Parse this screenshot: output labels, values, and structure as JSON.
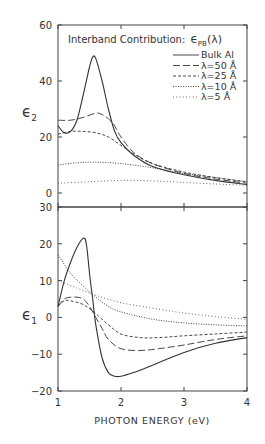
{
  "chart_data": [
    {
      "panel": "upper",
      "type": "line",
      "title": "Interband Contribution: εPB(λ)",
      "ylabel": "ε2",
      "xlabel": "",
      "xlim": [
        1,
        4
      ],
      "ylim": [
        0,
        60
      ],
      "yticks": [
        0,
        20,
        40,
        60
      ],
      "xticks": [
        1,
        2,
        3,
        4
      ],
      "legend_position": "upper right",
      "series": [
        {
          "name": "Bulk Al",
          "style": "solid",
          "x": [
            1.0,
            1.1,
            1.2,
            1.3,
            1.4,
            1.5,
            1.55,
            1.6,
            1.7,
            1.8,
            1.9,
            2.0,
            2.2,
            2.5,
            3.0,
            3.5,
            4.0
          ],
          "y": [
            24,
            21.5,
            22,
            26,
            35,
            45,
            48.5,
            48,
            40,
            30,
            22,
            18,
            13.5,
            9.5,
            6.5,
            4.5,
            3
          ]
        },
        {
          "name": "λ=50 Å",
          "style": "long-dash",
          "x": [
            1.0,
            1.2,
            1.4,
            1.6,
            1.7,
            1.8,
            1.9,
            2.0,
            2.2,
            2.5,
            3.0,
            3.5,
            4.0
          ],
          "y": [
            26,
            26,
            27,
            28.5,
            28,
            26.5,
            24,
            20,
            14.5,
            10.5,
            7,
            5,
            3.5
          ]
        },
        {
          "name": "λ=25 Å",
          "style": "short-dash",
          "x": [
            1.0,
            1.2,
            1.4,
            1.6,
            1.8,
            2.0,
            2.2,
            2.5,
            3.0,
            3.5,
            4.0
          ],
          "y": [
            21,
            22,
            22,
            21.5,
            20,
            17,
            14,
            10.5,
            7.5,
            5.5,
            4
          ]
        },
        {
          "name": "λ=10 Å",
          "style": "dotted",
          "x": [
            1.0,
            1.3,
            1.6,
            2.0,
            2.5,
            3.0,
            3.5,
            4.0
          ],
          "y": [
            10,
            10.8,
            11,
            10.5,
            9,
            7,
            5.5,
            4
          ]
        },
        {
          "name": "λ=5 Å",
          "style": "sparse-dotted",
          "x": [
            1.0,
            1.5,
            2.0,
            2.5,
            3.0,
            3.5,
            4.0
          ],
          "y": [
            3.5,
            4,
            4.5,
            4.3,
            3.8,
            3.2,
            2.8
          ]
        }
      ]
    },
    {
      "panel": "lower",
      "type": "line",
      "ylabel": "ε1",
      "xlabel": "PHOTON ENERGY (eV)",
      "xlim": [
        1,
        4
      ],
      "ylim": [
        -20,
        30
      ],
      "yticks": [
        -20,
        -10,
        0,
        10,
        20,
        30
      ],
      "xticks": [
        1,
        2,
        3,
        4
      ],
      "series": [
        {
          "name": "Bulk Al",
          "style": "solid",
          "x": [
            1.0,
            1.1,
            1.2,
            1.3,
            1.4,
            1.45,
            1.5,
            1.55,
            1.6,
            1.7,
            1.8,
            1.9,
            2.0,
            2.2,
            2.5,
            3.0,
            3.5,
            4.0
          ],
          "y": [
            3,
            10,
            15,
            19,
            21.5,
            20,
            12,
            5,
            -2,
            -11,
            -15,
            -16,
            -16,
            -15,
            -13,
            -9.5,
            -7,
            -5.5
          ]
        },
        {
          "name": "λ=50 Å",
          "style": "long-dash",
          "x": [
            1.0,
            1.1,
            1.2,
            1.3,
            1.4,
            1.5,
            1.6,
            1.7,
            1.8,
            2.0,
            2.3,
            2.6,
            3.0,
            3.5,
            4.0
          ],
          "y": [
            3,
            5,
            5.5,
            5.5,
            5,
            3,
            0,
            -3,
            -6,
            -8.5,
            -9,
            -8.5,
            -7.5,
            -6,
            -5
          ]
        },
        {
          "name": "λ=25 Å",
          "style": "short-dash",
          "x": [
            1.0,
            1.1,
            1.2,
            1.4,
            1.6,
            1.8,
            2.0,
            2.3,
            2.6,
            3.0,
            3.5,
            4.0
          ],
          "y": [
            3,
            4.5,
            4.5,
            3.5,
            1,
            -2,
            -4.5,
            -5.5,
            -5.5,
            -5,
            -4.5,
            -4
          ]
        },
        {
          "name": "λ=10 Å",
          "style": "dotted",
          "x": [
            1.0,
            1.2,
            1.4,
            1.6,
            1.8,
            2.0,
            2.5,
            3.0,
            3.5,
            4.0
          ],
          "y": [
            17,
            12,
            8.5,
            5.5,
            3,
            1.5,
            -0.5,
            -1.5,
            -2,
            -2.3
          ]
        },
        {
          "name": "λ=5 Å",
          "style": "sparse-dotted",
          "x": [
            1.0,
            1.3,
            1.6,
            2.0,
            2.5,
            3.0,
            3.5,
            4.0
          ],
          "y": [
            10,
            8,
            6,
            4,
            2.5,
            1.2,
            0.2,
            -0.5
          ]
        }
      ]
    }
  ],
  "labels": {
    "title_text": "Interband Contribution:",
    "title_symbol": "ϵ",
    "title_sub": "PB",
    "title_arg": "(λ)",
    "upper_ylabel": "ϵ",
    "upper_ylabel_sub": "2",
    "lower_ylabel": "ϵ",
    "lower_ylabel_sub": "1",
    "xlabel": "PHOTON ENERGY (eV)",
    "legend": [
      "Bulk Al",
      "λ=50 Å",
      "λ=25 Å",
      "λ=10 Å",
      "λ=5 Å"
    ]
  }
}
